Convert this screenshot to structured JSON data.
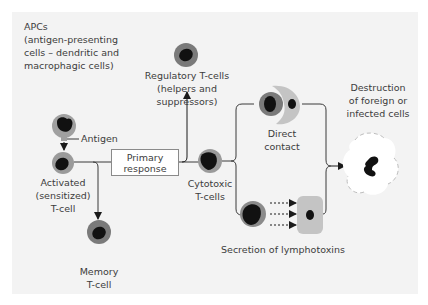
{
  "apcs": {
    "title": "APCs",
    "line1": "(antigen-presenting",
    "line2": "cells – dendritic and",
    "line3": "macrophagic cells)",
    "antigen_label": "Antigen"
  },
  "activated": {
    "line1": "Activated",
    "line2": "(sensitized)",
    "line3": "T-cell"
  },
  "memory": {
    "line1": "Memory",
    "line2": "T-cell"
  },
  "primary_response": {
    "line1": "Primary",
    "line2": "response"
  },
  "regulatory": {
    "line1": "Regulatory T-cells",
    "line2": "(helpers and",
    "line3": "suppressors)"
  },
  "cytotoxic": {
    "line1": "Cytotoxic",
    "line2": "T-cells"
  },
  "direct_contact": {
    "line1": "Direct",
    "line2": "contact"
  },
  "secretion": {
    "label": "Secretion of lymphotoxins"
  },
  "destruction": {
    "line1": "Destruction",
    "line2": "of foreign or",
    "line3": "infected cells"
  },
  "colors": {
    "panel": "#f3f3f3",
    "cell_ring": "#8c8c8c",
    "nucleus": "#111111",
    "target_cell": "#bdbdbd",
    "line": "#3a3a3a"
  }
}
